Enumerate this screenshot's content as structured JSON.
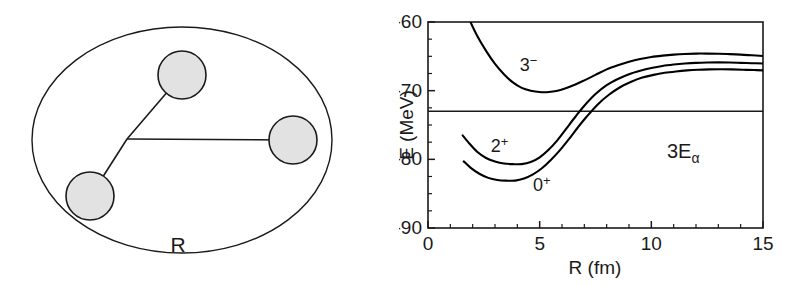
{
  "figure": {
    "panels": [
      "cluster-diagram",
      "energy-curve-plot"
    ]
  },
  "left_panel": {
    "name": "three-alpha-cluster-diagram",
    "boundary_shape": "ellipse",
    "distance_label": "R",
    "particles": [
      {
        "id": "alpha-top",
        "cx": 182,
        "cy": 75,
        "r": 24,
        "fill": "#e0e0e0"
      },
      {
        "id": "alpha-right",
        "cx": 293,
        "cy": 140,
        "r": 24,
        "fill": "#e0e0e0"
      },
      {
        "id": "alpha-bottom",
        "cx": 90,
        "cy": 196,
        "r": 24,
        "fill": "#e0e0e0"
      }
    ],
    "ellipse": {
      "cx": 182,
      "cy": 140,
      "rx": 150,
      "ry": 113
    },
    "bonds": [
      {
        "from": "alpha-top",
        "to": "vertex"
      },
      {
        "from": "alpha-bottom",
        "to": "vertex"
      },
      {
        "from": "vertex",
        "to": "alpha-right"
      }
    ],
    "vertex": {
      "x": 127,
      "cy": 139
    }
  },
  "chart_data": {
    "type": "line",
    "title": "",
    "xlabel": "R (fm)",
    "ylabel": "E (MeV)",
    "xlim": [
      0,
      15
    ],
    "ylim": [
      -90,
      -60
    ],
    "xticks": [
      0,
      5,
      10,
      15
    ],
    "xticklabels": [
      "0",
      "5",
      "10",
      "15"
    ],
    "xminor_step": 1,
    "yticks": [
      -90,
      -80,
      -70,
      -60
    ],
    "yticklabels": [
      "-90",
      "-80",
      "-70",
      "-60"
    ],
    "yminor_step": 2.5,
    "grid": false,
    "legend_position": "inline-annotations",
    "annotations": [
      {
        "text": "3E",
        "sub": "α",
        "name": "threshold-label",
        "x": 11.2,
        "y": -77.5
      }
    ],
    "threshold_line": {
      "name": "3-alpha-threshold",
      "value": -73.0,
      "label": "3Eα"
    },
    "series": [
      {
        "name": "3-",
        "label": "3",
        "superscript": "−",
        "label_x": 4.5,
        "label_y": -67.2,
        "color": "#000000",
        "x": [
          1.55,
          1.8,
          2.2,
          2.6,
          3.0,
          3.4,
          3.8,
          4.2,
          4.6,
          5.0,
          5.4,
          5.8,
          6.2,
          6.6,
          7.0,
          7.5,
          8.0,
          8.5,
          9.0,
          9.5,
          10.0,
          10.5,
          11.0,
          11.5,
          12.0,
          12.5,
          13.0,
          13.5,
          14.0,
          14.5,
          15.0
        ],
        "y": [
          -57.5,
          -59.3,
          -62.0,
          -64.2,
          -66.1,
          -67.6,
          -68.8,
          -69.6,
          -70.0,
          -70.2,
          -70.2,
          -70.0,
          -69.6,
          -69.1,
          -68.5,
          -67.7,
          -66.9,
          -66.3,
          -65.8,
          -65.4,
          -65.1,
          -64.9,
          -64.75,
          -64.65,
          -64.6,
          -64.6,
          -64.62,
          -64.68,
          -64.75,
          -64.85,
          -64.95
        ]
      },
      {
        "name": "2+",
        "label": "2",
        "superscript": "+",
        "label_x": 3.2,
        "label_y": -79.0,
        "color": "#000000",
        "x": [
          1.55,
          1.8,
          2.2,
          2.6,
          3.0,
          3.4,
          3.8,
          4.2,
          4.6,
          5.0,
          5.4,
          5.8,
          6.2,
          6.6,
          7.0,
          7.5,
          8.0,
          8.5,
          9.0,
          9.5,
          10.0,
          10.5,
          11.0,
          11.5,
          12.0,
          12.5,
          13.0,
          13.5,
          14.0,
          14.5,
          15.0
        ],
        "y": [
          -76.5,
          -77.5,
          -78.9,
          -79.8,
          -80.3,
          -80.6,
          -80.7,
          -80.7,
          -80.4,
          -79.7,
          -78.6,
          -77.2,
          -75.5,
          -73.8,
          -72.2,
          -70.5,
          -69.2,
          -68.3,
          -67.6,
          -67.1,
          -66.7,
          -66.4,
          -66.2,
          -66.05,
          -65.95,
          -65.9,
          -65.88,
          -65.9,
          -65.95,
          -66.0,
          -66.05
        ]
      },
      {
        "name": "0+",
        "label": "0",
        "superscript": "+",
        "label_x": 5.1,
        "label_y": -84.6,
        "color": "#000000",
        "x": [
          1.6,
          1.9,
          2.3,
          2.7,
          3.1,
          3.5,
          3.9,
          4.3,
          4.7,
          5.1,
          5.5,
          5.9,
          6.3,
          6.7,
          7.1,
          7.6,
          8.1,
          8.6,
          9.1,
          9.6,
          10.1,
          10.6,
          11.1,
          11.6,
          12.1,
          12.6,
          13.1,
          13.6,
          14.1,
          14.6,
          15.0
        ],
        "y": [
          -80.3,
          -81.2,
          -82.1,
          -82.7,
          -83.0,
          -83.1,
          -83.1,
          -82.8,
          -82.2,
          -81.3,
          -80.1,
          -78.7,
          -77.1,
          -75.4,
          -73.8,
          -72.0,
          -70.6,
          -69.5,
          -68.7,
          -68.1,
          -67.7,
          -67.4,
          -67.2,
          -67.05,
          -66.95,
          -66.9,
          -66.88,
          -66.9,
          -66.95,
          -67.0,
          -67.05
        ]
      }
    ]
  }
}
